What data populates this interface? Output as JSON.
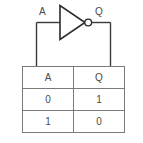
{
  "diagram": {
    "gate": {
      "type": "not-gate",
      "input_label": "A",
      "output_label": "Q",
      "bubble": "inverting-bubble"
    },
    "colors": {
      "wire": "#3a3a3a",
      "gate_outline": "#2b2b2b",
      "table_border": "#7a7a7a",
      "text": "#4a4a4a",
      "background": "#ffffff"
    }
  },
  "truth_table": {
    "headers": [
      "A",
      "Q"
    ],
    "rows": [
      [
        "0",
        "1"
      ],
      [
        "1",
        "0"
      ]
    ]
  }
}
